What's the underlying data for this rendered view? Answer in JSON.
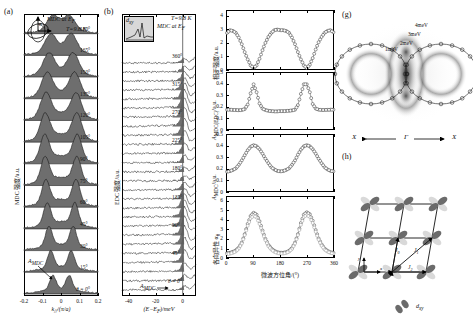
{
  "figure": {
    "panels": [
      "(a)",
      "(b)",
      "(c)",
      "(d)",
      "(e)",
      "(f)",
      "(g)",
      "(h)"
    ]
  },
  "panel_a": {
    "label": "(a)",
    "title": "MDC at E",
    "title_sub": "F",
    "temperature": "T=9.8 K",
    "ylabel": "MDC 强度/a.u.",
    "xlabel": "k",
    "xlabel_sub": "//",
    "xlabel_unit": "/(π/a)",
    "xticks": [
      "-0.2",
      "-0.1",
      "0",
      "0.1",
      "0.2"
    ],
    "angles": [
      "180°",
      "165°",
      "150°",
      "135°",
      "120°",
      "105°",
      "90°",
      "75°",
      "60°",
      "45°",
      "30°",
      "15°",
      "θ = 0°"
    ],
    "annotation": "A",
    "annotation_sub": "MDC",
    "inset_angle": "θ"
  },
  "panel_b": {
    "label": "(b)",
    "title": "MDC at E",
    "title_sub": "F",
    "temperature": "T=9.8 K",
    "ylabel": "EDC 强度/a.u.",
    "xlabel": "(E−E",
    "xlabel_sub": "F",
    "xlabel_unit": ")/meV",
    "xticks": [
      "-40",
      "-20",
      "0"
    ],
    "angles": [
      "360°",
      "315°",
      "270°",
      "225°",
      "180°",
      "135°",
      "90°",
      "45°",
      "θ = 0°"
    ],
    "annotation": "A",
    "annotation_sub": "MDC",
    "inset_label": "d",
    "inset_label_sub": "xy"
  },
  "panel_c": {
    "label": "(c)",
    "ylabel": "相干强度/a.u.",
    "yticks": [
      "0",
      "1",
      "2",
      "3",
      "4"
    ]
  },
  "panel_d": {
    "label": "(d)",
    "ylabel": "A",
    "ylabel_sub": "MDC(EDC)",
    "ylabel_unit": "/a.u.",
    "yticks": [
      "0",
      "0.1",
      "0.2",
      "0.3",
      "0.4",
      "0.5"
    ]
  },
  "panel_e": {
    "label": "(e)",
    "ylabel": "A",
    "ylabel_sub": "MDC",
    "ylabel_unit": "/a.u.",
    "yticks": [
      "0",
      "0.1",
      "0.2",
      "0.3",
      "0.4",
      "0.5"
    ]
  },
  "panel_f": {
    "label": "(f)",
    "ylabel": "各向异性 α",
    "ylabel_sub": "θ",
    "yticks": [
      "0",
      "1",
      "2",
      "3",
      "4",
      "5",
      "6"
    ],
    "xlabel": "微波方位角/(°)",
    "xticks": [
      "0",
      "90",
      "180",
      "270",
      "360"
    ]
  },
  "panel_g": {
    "label": "(g)",
    "contour_labels": [
      "4meV",
      "3meV",
      "2meV",
      "1meV"
    ],
    "axis_left": "X",
    "axis_center": "Γ",
    "axis_right": "X"
  },
  "panel_h": {
    "label": "(h)",
    "orbital_label": "d",
    "orbital_label_sub": "xy",
    "couplings": [
      "J",
      "J",
      "J"
    ],
    "coupling_subs": [
      "0",
      "1",
      "2"
    ],
    "axis_x": "x",
    "axis_y": "y"
  },
  "chart_data": [
    {
      "type": "line",
      "panel": "(c)",
      "title": "",
      "ylabel": "相干强度/a.u.",
      "xlabel": "微波方位角/(°)",
      "xlim": [
        0,
        360
      ],
      "ylim": [
        0,
        4.4
      ],
      "x": [
        0,
        10,
        20,
        30,
        40,
        50,
        60,
        70,
        80,
        90,
        100,
        110,
        120,
        130,
        140,
        150,
        160,
        170,
        180,
        190,
        200,
        210,
        220,
        230,
        240,
        250,
        260,
        270,
        280,
        290,
        300,
        310,
        320,
        330,
        340,
        350,
        360
      ],
      "values": [
        2.75,
        2.95,
        2.9,
        2.75,
        2.4,
        1.9,
        1.3,
        0.75,
        0.3,
        0.12,
        0.3,
        0.8,
        1.45,
        2.0,
        2.45,
        2.75,
        2.95,
        3.0,
        2.95,
        2.95,
        2.9,
        2.75,
        2.4,
        1.9,
        1.3,
        0.75,
        0.3,
        0.1,
        0.35,
        0.85,
        1.5,
        2.05,
        2.45,
        2.75,
        2.9,
        2.95,
        2.8
      ],
      "grid": false,
      "legend": "none",
      "marker": "open-circle"
    },
    {
      "type": "line",
      "panel": "(d)",
      "ylabel": "A_MDC(EDC)/a.u.",
      "xlabel": "微波方位角/(°)",
      "xlim": [
        0,
        360
      ],
      "ylim": [
        0,
        0.5
      ],
      "x": [
        0,
        10,
        20,
        30,
        40,
        50,
        60,
        70,
        80,
        90,
        100,
        110,
        120,
        130,
        140,
        150,
        160,
        170,
        180,
        190,
        200,
        210,
        220,
        230,
        240,
        250,
        260,
        270,
        280,
        290,
        300,
        310,
        320,
        330,
        340,
        350,
        360
      ],
      "values": [
        0.175,
        0.175,
        0.172,
        0.172,
        0.17,
        0.172,
        0.18,
        0.22,
        0.32,
        0.4,
        0.33,
        0.23,
        0.185,
        0.172,
        0.165,
        0.162,
        0.16,
        0.16,
        0.162,
        0.162,
        0.163,
        0.165,
        0.168,
        0.175,
        0.215,
        0.315,
        0.4,
        0.4,
        0.33,
        0.225,
        0.185,
        0.175,
        0.172,
        0.172,
        0.173,
        0.175,
        0.175
      ],
      "grid": false,
      "legend": "none",
      "marker": "open-circle"
    },
    {
      "type": "line",
      "panel": "(e)",
      "ylabel": "A_MDC/a.u.",
      "xlabel": "微波方位角/(°)",
      "xlim": [
        0,
        360
      ],
      "ylim": [
        0,
        0.5
      ],
      "x": [
        0,
        10,
        20,
        30,
        40,
        50,
        60,
        70,
        80,
        90,
        100,
        110,
        120,
        130,
        140,
        150,
        160,
        170,
        180,
        190,
        200,
        210,
        220,
        230,
        240,
        250,
        260,
        270,
        280,
        290,
        300,
        310,
        320,
        330,
        340,
        350,
        360
      ],
      "values": [
        0.175,
        0.18,
        0.19,
        0.205,
        0.235,
        0.275,
        0.32,
        0.365,
        0.395,
        0.41,
        0.4,
        0.375,
        0.335,
        0.29,
        0.25,
        0.215,
        0.195,
        0.182,
        0.178,
        0.18,
        0.19,
        0.205,
        0.235,
        0.275,
        0.325,
        0.37,
        0.4,
        0.41,
        0.4,
        0.375,
        0.335,
        0.29,
        0.25,
        0.215,
        0.195,
        0.182,
        0.178
      ],
      "grid": false,
      "legend": "none",
      "marker": "open-circle"
    },
    {
      "type": "line",
      "panel": "(f)",
      "ylabel": "各向异性 αθ",
      "xlabel": "微波方位角/(°)",
      "xlim": [
        0,
        360
      ],
      "ylim": [
        0,
        6.5
      ],
      "x": [
        0,
        10,
        20,
        30,
        40,
        50,
        60,
        70,
        80,
        90,
        100,
        110,
        120,
        130,
        140,
        150,
        160,
        170,
        180,
        190,
        200,
        210,
        220,
        230,
        240,
        250,
        260,
        270,
        280,
        290,
        300,
        310,
        320,
        330,
        340,
        350,
        360
      ],
      "series": [
        {
          "name": "series-1",
          "values": [
            0.45,
            0.5,
            0.6,
            0.75,
            1.05,
            1.6,
            2.5,
            3.6,
            4.45,
            4.8,
            4.6,
            3.9,
            2.9,
            2.0,
            1.35,
            0.95,
            0.7,
            0.55,
            0.5,
            0.5,
            0.55,
            0.7,
            1.0,
            1.6,
            2.5,
            3.7,
            4.6,
            4.85,
            4.65,
            3.95,
            2.95,
            2.05,
            1.4,
            0.95,
            0.7,
            0.55,
            0.5
          ]
        },
        {
          "name": "series-2",
          "values": [
            0.35,
            0.4,
            0.5,
            0.65,
            0.95,
            1.5,
            2.4,
            3.4,
            4.2,
            4.5,
            4.3,
            3.6,
            2.7,
            1.85,
            1.2,
            0.85,
            0.6,
            0.48,
            0.42,
            0.42,
            0.48,
            0.62,
            0.9,
            1.5,
            2.4,
            3.5,
            4.35,
            4.55,
            4.35,
            3.7,
            2.75,
            1.9,
            1.25,
            0.85,
            0.62,
            0.48,
            0.42
          ]
        }
      ],
      "grid": false,
      "legend": "none",
      "marker": "open-circle"
    }
  ],
  "colors": {
    "fill": "#6e6e6e",
    "line": "#111111",
    "marker_stroke": "#333333"
  }
}
